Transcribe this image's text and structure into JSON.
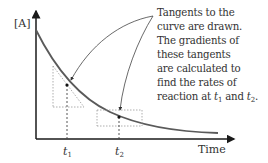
{
  "diagram": {
    "y_axis_label": "[A]",
    "x_axis_label": "Time",
    "markers": [
      {
        "label": "t",
        "subscript": "1"
      },
      {
        "label": "t",
        "subscript": "2"
      }
    ],
    "annotation": {
      "lines": [
        "Tangents to the",
        "curve are drawn.",
        "The gradients of",
        "these tangents",
        "are calculated to",
        "find the rates of"
      ],
      "last_line_prefix": "reaction at ",
      "t1": "t",
      "t1_sub": "1",
      "conjunction": " and ",
      "t2": "t",
      "t2_sub": "2",
      "period": "."
    },
    "colors": {
      "axis": "#1a1a1a",
      "curve": "#555555",
      "text": "#333333",
      "guides": "#888888"
    }
  }
}
